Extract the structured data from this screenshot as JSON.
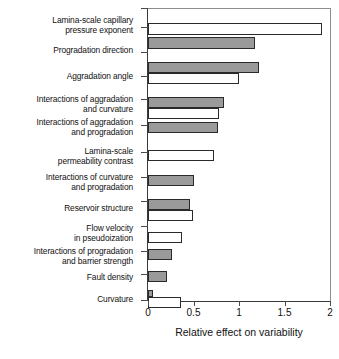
{
  "chart_data": {
    "type": "bar",
    "orientation": "horizontal",
    "title": "",
    "xlabel": "Relative effect on variability",
    "ylabel": "",
    "xlim": [
      0,
      2
    ],
    "xticks": [
      0,
      0.5,
      1,
      1.5,
      2
    ],
    "xtick_labels": [
      "0",
      "0.5",
      "1",
      "1.5",
      "2"
    ],
    "grid": false,
    "legend": false,
    "categories": [
      "Lamina-scale capillary pressure exponent",
      "Progradation direction",
      "Aggradation angle",
      "Interactions of aggradation and curvature",
      "Interactions of aggradation and progradation",
      "Lamina-scale permeability contrast",
      "Interactions of curvature and progradation",
      "Reservoir structure",
      "Flow velocity in pseudoization",
      "Interactions of progradation and barrier strength",
      "Fault density",
      "Curvature"
    ],
    "series": [
      {
        "name": "white",
        "fill": "#ffffff",
        "values": [
          1.91,
          null,
          1.0,
          0.78,
          null,
          0.72,
          null,
          0.49,
          0.37,
          null,
          null,
          0.36
        ]
      },
      {
        "name": "gray",
        "fill": "#9a9a9a",
        "values": [
          null,
          1.18,
          1.22,
          0.83,
          0.77,
          null,
          0.5,
          0.46,
          null,
          0.26,
          0.21,
          0.05
        ]
      }
    ],
    "bars": [
      {
        "label": "Lamina-scale capillary pressure exponent",
        "value": 1.91,
        "fill": "white"
      },
      {
        "label": "Progradation direction",
        "value": 1.18,
        "fill": "gray"
      },
      {
        "label": "Aggradation angle",
        "value": 1.22,
        "fill": "gray"
      },
      {
        "label": "Aggradation angle",
        "value": 1.0,
        "fill": "white"
      },
      {
        "label": "Interactions of aggradation and curvature",
        "value": 0.83,
        "fill": "gray"
      },
      {
        "label": "Interactions of aggradation and curvature",
        "value": 0.78,
        "fill": "white"
      },
      {
        "label": "Interactions of aggradation and progradation",
        "value": 0.77,
        "fill": "gray"
      },
      {
        "label": "Lamina-scale permeability contrast",
        "value": 0.72,
        "fill": "white"
      },
      {
        "label": "Interactions of curvature and progradation",
        "value": 0.5,
        "fill": "gray"
      },
      {
        "label": "Reservoir structure",
        "value": 0.46,
        "fill": "gray"
      },
      {
        "label": "Reservoir structure",
        "value": 0.49,
        "fill": "white"
      },
      {
        "label": "Flow velocity in pseudoization",
        "value": 0.37,
        "fill": "white"
      },
      {
        "label": "Interactions of progradation and barrier strength",
        "value": 0.26,
        "fill": "gray"
      },
      {
        "label": "Fault density",
        "value": 0.21,
        "fill": "gray"
      },
      {
        "label": "Curvature",
        "value": 0.05,
        "fill": "gray"
      },
      {
        "label": "Curvature",
        "value": 0.36,
        "fill": "white"
      }
    ]
  },
  "axis": {
    "x_title": "Relative effect on variability",
    "tick_0": "0",
    "tick_1": "0.5",
    "tick_2": "1",
    "tick_3": "1.5",
    "tick_4": "2"
  },
  "labels": {
    "l0_line1": "Lamina-scale capillary",
    "l0_line2": "pressure exponent",
    "l1_line1": "Progradation direction",
    "l2_line1": "Aggradation angle",
    "l3_line1": "Interactions of aggradation",
    "l3_line2": "and curvature",
    "l4_line1": "Interactions of aggradation",
    "l4_line2": "and progradation",
    "l5_line1": "Lamina-scale",
    "l5_line2": "permeability contrast",
    "l6_line1": "Interactions of curvature",
    "l6_line2": "and progradation",
    "l7_line1": "Reservoir structure",
    "l8_line1": "Flow velocity",
    "l8_line2": "in pseudoization",
    "l9_line1": "Interactions of progradation",
    "l9_line2": "and barrier strength",
    "l10_line1": "Fault density",
    "l11_line1": "Curvature"
  }
}
